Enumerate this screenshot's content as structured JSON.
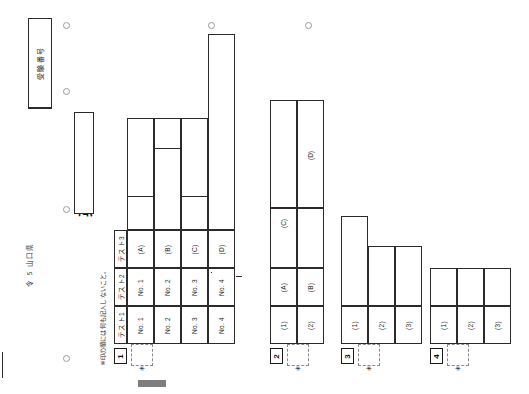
{
  "document": {
    "title": "英語解答用紙",
    "prefecture_line": "令 5   山口県",
    "note": "※印の欄には何も記入しないこと。",
    "exam_number_label": "受験番号"
  },
  "sections": [
    {
      "number": "1",
      "has_star_box": true,
      "rows": [
        {
          "label": "テスト1",
          "cells": [
            "No. 1",
            "No. 2",
            "No. 3",
            "No. 4"
          ]
        },
        {
          "label": "テスト2",
          "cells": [
            "No. 1",
            "No. 2",
            "No. 3",
            "No. 4"
          ]
        },
        {
          "label": "テスト3",
          "cells": [
            "(A)",
            "(B)",
            "(C)",
            "(D)"
          ]
        }
      ]
    },
    {
      "number": "2",
      "has_star_box": true,
      "rows": [
        {
          "label": "",
          "cells": [
            "(1)",
            "(2)",
            "(3)",
            "(4)"
          ]
        },
        {
          "label": "",
          "cells": [
            "(A)",
            "(B)",
            "(C)",
            "(D)"
          ]
        }
      ]
    },
    {
      "number": "3",
      "has_star_box": true,
      "rows": [
        {
          "label": "",
          "cells": [
            "(1)",
            "(2)",
            "(3)"
          ]
        }
      ]
    },
    {
      "number": "4",
      "has_star_box": true,
      "rows": [
        {
          "label": "",
          "cells": [
            "(1)",
            "(2)",
            "(3)"
          ]
        }
      ]
    }
  ]
}
